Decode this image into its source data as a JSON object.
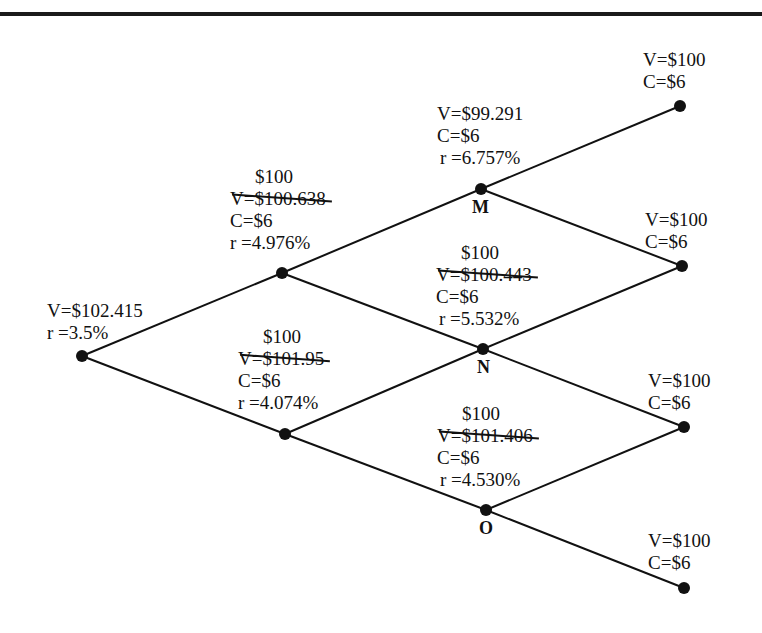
{
  "diagram": {
    "type": "binomial-interest-rate-tree",
    "nodes": {
      "root": {
        "value": "V=$102.415",
        "rate": "r =3.5%"
      },
      "up1": {
        "new_value": "$100",
        "old_value": "V=$100.638",
        "coupon": "C=$6",
        "rate": "r =4.976%"
      },
      "down1": {
        "new_value": "$100",
        "old_value": "V=$101.95",
        "coupon": "C=$6",
        "rate": "r =4.074%"
      },
      "M": {
        "letter": "M",
        "value": "V=$99.291",
        "coupon": "C=$6",
        "rate": "r =6.757%"
      },
      "N": {
        "letter": "N",
        "new_value": "$100",
        "old_value": "V=$100.443",
        "coupon": "C=$6",
        "rate": "r =5.532%"
      },
      "O": {
        "letter": "O",
        "new_value": "$100",
        "old_value": "V=$101.406",
        "coupon": "C=$6",
        "rate": "r =4.530%"
      },
      "t1": {
        "value": "V=$100",
        "coupon": "C=$6"
      },
      "t2": {
        "value": "V=$100",
        "coupon": "C=$6"
      },
      "t3": {
        "value": "V=$100",
        "coupon": "C=$6"
      },
      "t4": {
        "value": "V=$100",
        "coupon": "C=$6"
      }
    }
  }
}
